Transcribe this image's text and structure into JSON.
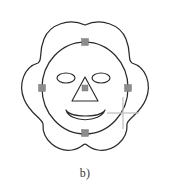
{
  "figure": {
    "caption": "b)",
    "background_color": "#ffffff",
    "stroke_color": "#2b2b2b",
    "handle_color": "#8c8c8c",
    "cursor_color": "#c2c2c2"
  },
  "drawing": {
    "flower": {
      "name": "five-petal-flower-outline",
      "petal_count": 5,
      "center": {
        "x": 85,
        "y": 88
      },
      "outer_radius": 63
    },
    "selected_ellipse": {
      "name": "face-ellipse",
      "center": {
        "x": 85,
        "y": 88
      },
      "radius_x": 43,
      "radius_y": 46,
      "selected": true
    },
    "left_eye": {
      "name": "left-eye-ellipse",
      "center": {
        "x": 66,
        "y": 78
      },
      "radius_x": 9,
      "radius_y": 5
    },
    "right_eye": {
      "name": "right-eye-ellipse",
      "center": {
        "x": 101,
        "y": 78
      },
      "radius_x": 9,
      "radius_y": 5
    },
    "nose": {
      "name": "nose-triangle",
      "apex": {
        "x": 85,
        "y": 77
      },
      "base_left": {
        "x": 72,
        "y": 101
      },
      "base_right": {
        "x": 98,
        "y": 101
      }
    },
    "mouth": {
      "name": "smile-crescent",
      "left": {
        "x": 66,
        "y": 110
      },
      "right": {
        "x": 105,
        "y": 110
      },
      "bottom": {
        "x": 85,
        "y": 124
      }
    },
    "handles": [
      {
        "name": "handle-top",
        "x": 85,
        "y": 42
      },
      {
        "name": "handle-left",
        "x": 42,
        "y": 88
      },
      {
        "name": "handle-right",
        "x": 128,
        "y": 88
      },
      {
        "name": "handle-bottom",
        "x": 85,
        "y": 133
      },
      {
        "name": "handle-nose-center",
        "x": 85,
        "y": 88
      }
    ],
    "cursor": {
      "name": "crosshair-cursor",
      "center": {
        "x": 123,
        "y": 113
      },
      "arm_length": 16
    }
  }
}
